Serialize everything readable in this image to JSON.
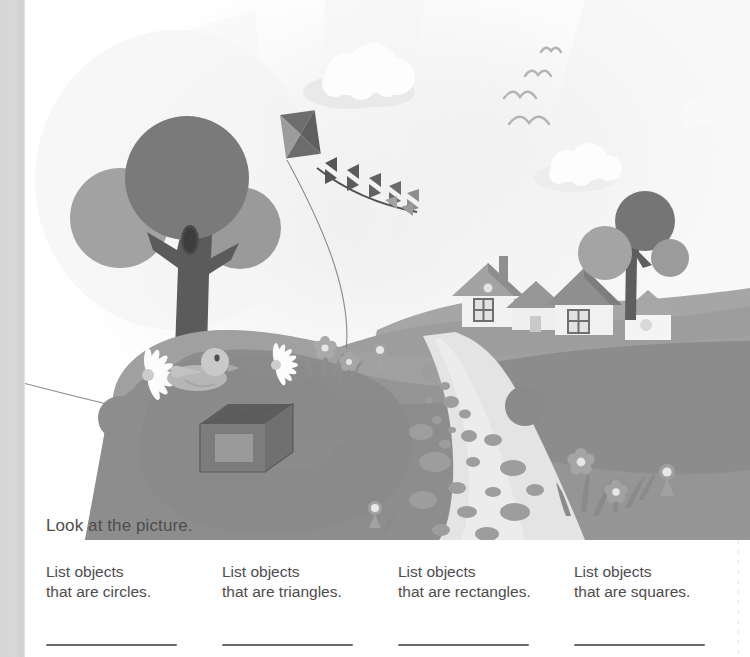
{
  "worksheet": {
    "instruction": "Look at the picture.",
    "prompts": [
      {
        "line1": "List objects",
        "line2": "that are circles.",
        "shape": "circle"
      },
      {
        "line1": "List objects",
        "line2": "that are triangles.",
        "shape": "triangle"
      },
      {
        "line1": "List objects",
        "line2": "that are rectangles.",
        "shape": "rectangle"
      },
      {
        "line1": "List objects",
        "line2": "that are squares.",
        "shape": "square"
      }
    ],
    "answer_lines": [
      "",
      "",
      "",
      ""
    ]
  },
  "illustration": {
    "title": "Park landscape with kite, trees, houses and path",
    "scene_elements": [
      "sky",
      "clouds",
      "flying-birds",
      "kite",
      "kite-string",
      "kite-tail-bows",
      "big-tree",
      "small-tree",
      "tree-hollow",
      "houses",
      "chimney",
      "windows",
      "hills",
      "stone-path",
      "path-stones",
      "daisies",
      "flowers",
      "grass-tufts",
      "duck",
      "wireframe-cube",
      "ball"
    ],
    "colors": {
      "sky": "#fbfbfb",
      "sky_glow": "#f2f2f2",
      "cloud": "#fefefe",
      "cloud_shadow": "#ececec",
      "bird_outline": "#b9b9b9",
      "foliage_dark": "#7b7b7b",
      "foliage_light": "#a8a8a8",
      "trunk": "#5d5d5d",
      "hill_far": "#a3a3a3",
      "hill_mid": "#9a9a9a",
      "hill_near": "#8f8f8f",
      "hill_shadow": "#858585",
      "path": "#e0e0e0",
      "stone": "#9f9f9f",
      "house_wall": "#f0f0f0",
      "house_roof": "#9d9d9d",
      "house_roof_dark": "#848484",
      "kite_dark": "#6e6e6e",
      "kite_light": "#9b9b9b",
      "cube": "#6f6f6f",
      "cube_top": "#5e5e5e",
      "text": "#4d4d4d",
      "rule": "#6b6b6b",
      "page_edge": "#d6d6d6"
    },
    "counts": {
      "clouds": 3,
      "birds": 4,
      "houses": 3,
      "trees": 2,
      "daisies": 2,
      "flowers": 7,
      "kite_tail_bows": 7
    }
  }
}
